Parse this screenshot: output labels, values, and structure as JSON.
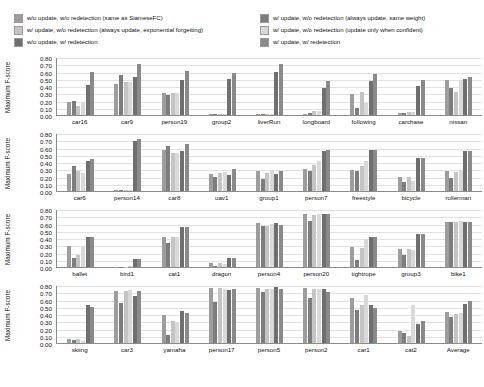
{
  "legend": {
    "series_colors": [
      "#9d9d9d",
      "#7d7d7d",
      "#c4c4c4",
      "#d9d9d9",
      "#6f6f6f",
      "#8a8a8a"
    ],
    "left_items": [
      {
        "label": "w/o update, w/o redetection (same as SiameseFC)",
        "color": "#9d9d9d"
      },
      {
        "label": "w/ update, w/o redetection (always update, exponential forgetting)",
        "color": "#c4c4c4"
      },
      {
        "label": "w/o update, w/ redetection",
        "color": "#6f6f6f"
      }
    ],
    "right_items": [
      {
        "label": "w/ update, w/o redetection (always update, same weight)",
        "color": "#7d7d7d"
      },
      {
        "label": "w/ update, w/o redetection (update only when confident)",
        "color": "#d9d9d9"
      },
      {
        "label": "w/ update, w/ redetection",
        "color": "#8a8a8a"
      }
    ]
  },
  "chart_data": {
    "type": "bar",
    "title": "",
    "xlabel": "",
    "ylabel": "Maximum F-score",
    "ylim": [
      0.0,
      0.8
    ],
    "yticks": [
      "0.00",
      "0.10",
      "0.20",
      "0.30",
      "0.40",
      "0.50",
      "0.60",
      "0.70",
      "0.80"
    ],
    "grid": true,
    "legend_position": "top",
    "series_names": [
      "w/o update, w/o redetection (same as SiameseFC)",
      "w/ update, w/o redetection (always update, same weight)",
      "w/ update, w/o redetection (always update, exponential forgetting)",
      "w/ update, w/o redetection (update only when confident)",
      "w/o update, w/ redetection",
      "w/ update, w/ redetection"
    ],
    "panels": [
      {
        "categories": [
          "car16",
          "car9",
          "person19",
          "group2",
          "liverRun",
          "longboard",
          "following",
          "carchase",
          "nissan"
        ],
        "values": [
          [
            0.18,
            0.19,
            0.13,
            0.18,
            0.41,
            0.6
          ],
          [
            0.43,
            0.55,
            0.46,
            0.45,
            0.53,
            0.71
          ],
          [
            0.31,
            0.27,
            0.31,
            0.31,
            0.48,
            0.61
          ],
          [
            0.01,
            0.01,
            0.01,
            0.01,
            0.49,
            0.58
          ],
          [
            0.01,
            0.01,
            0.01,
            0.01,
            0.6,
            0.71
          ],
          [
            0.02,
            0.03,
            0.05,
            0.05,
            0.37,
            0.47
          ],
          [
            0.29,
            0.09,
            0.32,
            0.17,
            0.47,
            0.56
          ],
          [
            0.03,
            0.03,
            0.04,
            0.04,
            0.4,
            0.48
          ],
          [
            0.48,
            0.37,
            0.32,
            0.48,
            0.49,
            0.52
          ]
        ]
      },
      {
        "categories": [
          "car6",
          "person14",
          "car8",
          "uav1",
          "group1",
          "person7",
          "freestyle",
          "bicycle",
          "rollerman"
        ],
        "values": [
          [
            0.24,
            0.34,
            0.28,
            0.25,
            0.41,
            0.44
          ],
          [
            0.02,
            0.02,
            0.02,
            0.02,
            0.69,
            0.72
          ],
          [
            0.57,
            0.62,
            0.53,
            0.53,
            0.55,
            0.65
          ],
          [
            0.24,
            0.2,
            0.25,
            0.26,
            0.22,
            0.3
          ],
          [
            0.27,
            0.17,
            0.25,
            0.29,
            0.24,
            0.28
          ],
          [
            0.31,
            0.27,
            0.36,
            0.42,
            0.55,
            0.57
          ],
          [
            0.29,
            0.27,
            0.34,
            0.41,
            0.56,
            0.56
          ],
          [
            0.19,
            0.13,
            0.19,
            0.14,
            0.45,
            0.46
          ],
          [
            0.27,
            0.18,
            0.26,
            0.28,
            0.55,
            0.55
          ]
        ]
      },
      {
        "categories": [
          "ballet",
          "bird1",
          "cat1",
          "dragon",
          "person4",
          "person20",
          "tightrope",
          "group3",
          "bike1"
        ],
        "values": [
          [
            0.29,
            0.12,
            0.17,
            0.29,
            0.41,
            0.41
          ],
          [
            0.0,
            0.0,
            0.0,
            0.01,
            0.11,
            0.11
          ],
          [
            0.42,
            0.33,
            0.41,
            0.42,
            0.55,
            0.55
          ],
          [
            0.06,
            0.01,
            0.06,
            0.04,
            0.12,
            0.13
          ],
          [
            0.61,
            0.57,
            0.57,
            0.6,
            0.61,
            0.58
          ],
          [
            0.73,
            0.63,
            0.72,
            0.73,
            0.73,
            0.73
          ],
          [
            0.28,
            0.09,
            0.26,
            0.38,
            0.42,
            0.42
          ],
          [
            0.25,
            0.17,
            0.25,
            0.24,
            0.46,
            0.46
          ],
          [
            0.62,
            0.62,
            0.62,
            0.63,
            0.62,
            0.62
          ]
        ]
      },
      {
        "categories": [
          "skiing",
          "car3",
          "yamaha",
          "person17",
          "person5",
          "person2",
          "car1",
          "cat2",
          "Average"
        ],
        "values": [
          [
            0.05,
            0.04,
            0.06,
            0.03,
            0.52,
            0.5
          ],
          [
            0.72,
            0.55,
            0.72,
            0.73,
            0.65,
            0.72
          ],
          [
            0.38,
            0.11,
            0.31,
            0.27,
            0.44,
            0.42
          ],
          [
            0.76,
            0.57,
            0.76,
            0.74,
            0.73,
            0.74
          ],
          [
            0.76,
            0.7,
            0.74,
            0.75,
            0.77,
            0.74
          ],
          [
            0.76,
            0.62,
            0.75,
            0.75,
            0.75,
            0.71
          ],
          [
            0.62,
            0.45,
            0.52,
            0.66,
            0.53,
            0.48
          ],
          [
            0.17,
            0.14,
            0.09,
            0.52,
            0.26,
            0.31
          ],
          [
            0.43,
            0.36,
            0.4,
            0.42,
            0.54,
            0.58
          ]
        ]
      }
    ]
  }
}
